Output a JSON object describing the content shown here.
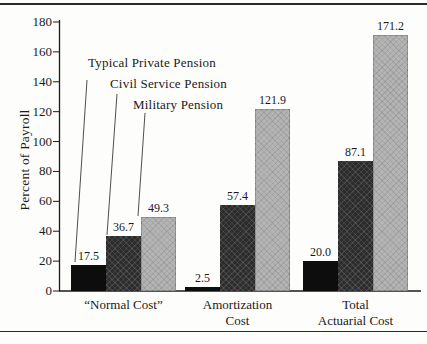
{
  "chart_data": {
    "type": "bar",
    "title": "",
    "xlabel": "",
    "ylabel": "Percent of Payroll",
    "ylim": [
      0,
      180
    ],
    "y_ticks": [
      0,
      20,
      40,
      60,
      80,
      100,
      120,
      140,
      160,
      180
    ],
    "grid": false,
    "legend_position": "top-left-inline-leader-lines",
    "categories": [
      "“Normal Cost”",
      "Amortization\nCost",
      "Total\nActuarial Cost"
    ],
    "series": [
      {
        "name": "Typical Private Pension",
        "color": "#0d0d0d",
        "pattern": "solid-black",
        "values": [
          17.5,
          2.5,
          20.0
        ]
      },
      {
        "name": "Civil Service Pension",
        "color": "#2c2c2c",
        "pattern": "dark-crosshatch",
        "values": [
          36.7,
          57.4,
          87.1
        ]
      },
      {
        "name": "Military Pension",
        "color": "#b4b4b4",
        "pattern": "light-gray-crosshatch",
        "values": [
          49.3,
          121.9,
          171.2
        ]
      }
    ],
    "value_label_format": "one-decimal"
  }
}
